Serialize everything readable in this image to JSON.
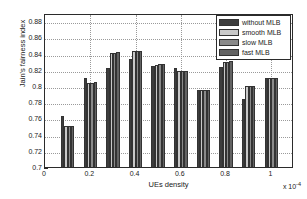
{
  "chart_data": {
    "type": "bar",
    "title": "",
    "xlabel": "UEs density",
    "ylabel": "Jain's fairness index",
    "x_multiplier": "x 10",
    "x_multiplier_exp": "-4",
    "xlim": [
      0,
      1.1
    ],
    "ylim": [
      0.7,
      0.89
    ],
    "grid": true,
    "legend_position": "top-right",
    "xticks": [
      "0",
      "0.2",
      "0.4",
      "0.6",
      "0.8",
      "1"
    ],
    "xtick_values": [
      0,
      0.2,
      0.4,
      0.6,
      0.8,
      1.0
    ],
    "yticks": [
      "0.7",
      "0.72",
      "0.74",
      "0.76",
      "0.78",
      "0.8",
      "0.82",
      "0.84",
      "0.86",
      "0.88"
    ],
    "ytick_values": [
      0.7,
      0.72,
      0.74,
      0.76,
      0.78,
      0.8,
      0.82,
      0.84,
      0.86,
      0.88
    ],
    "categories": [
      0.1,
      0.2,
      0.3,
      0.4,
      0.5,
      0.6,
      0.7,
      0.8,
      0.9,
      1.0
    ],
    "series": [
      {
        "name": "without MLB",
        "color": "#3d3d3d",
        "values": [
          0.765,
          0.812,
          0.825,
          0.836,
          0.827,
          0.824,
          0.798,
          0.826,
          0.786,
          0.812
        ]
      },
      {
        "name": "smooth MLB",
        "color": "#c9c9c9",
        "values": [
          0.753,
          0.806,
          0.843,
          0.845,
          0.828,
          0.821,
          0.798,
          0.832,
          0.802,
          0.812
        ]
      },
      {
        "name": "slow MLB",
        "color": "#8a8a8a",
        "values": [
          0.753,
          0.806,
          0.843,
          0.845,
          0.829,
          0.821,
          0.798,
          0.832,
          0.802,
          0.812
        ]
      },
      {
        "name": "fast MLB",
        "color": "#636363",
        "values": [
          0.753,
          0.807,
          0.844,
          0.846,
          0.83,
          0.821,
          0.798,
          0.833,
          0.802,
          0.812
        ]
      }
    ]
  }
}
